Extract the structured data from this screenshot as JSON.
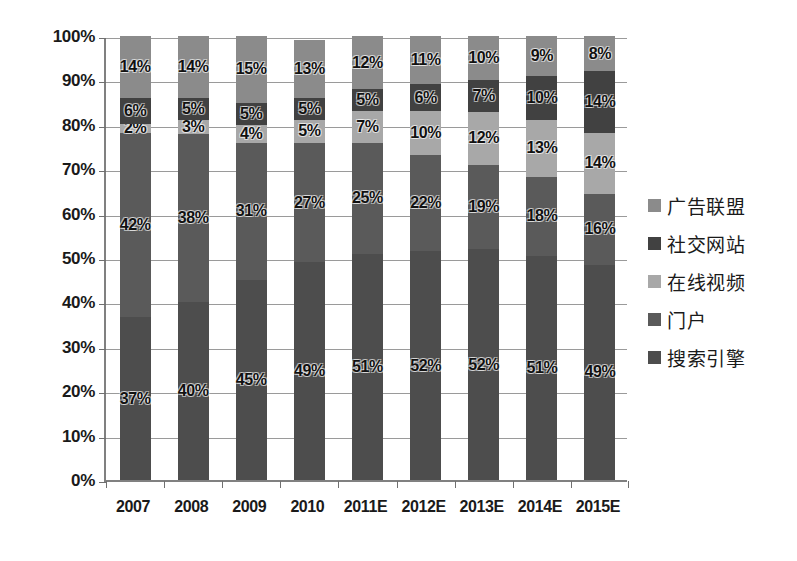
{
  "chart_data": {
    "type": "bar",
    "stacked": true,
    "stack_total": 100,
    "title": "",
    "subtitle": "",
    "xlabel": "",
    "ylabel": "",
    "ylim": [
      0,
      100
    ],
    "yticks": [
      "0%",
      "10%",
      "20%",
      "30%",
      "40%",
      "50%",
      "60%",
      "70%",
      "80%",
      "90%",
      "100%"
    ],
    "ytick_values": [
      0,
      10,
      20,
      30,
      40,
      50,
      60,
      70,
      80,
      90,
      100
    ],
    "grid": true,
    "grid_axis": "y",
    "legend_position": "right",
    "value_label_suffix": "%",
    "categories": [
      "2007",
      "2008",
      "2009",
      "2010",
      "2011E",
      "2012E",
      "2013E",
      "2014E",
      "2015E"
    ],
    "series": [
      {
        "name": "搜索引擎",
        "color": "#4d4d4d",
        "values": [
          37,
          40,
          45,
          49,
          51,
          52,
          52,
          51,
          49
        ],
        "labels": [
          "37%",
          "40%",
          "45%",
          "49%",
          "51%",
          "52%",
          "52%",
          "51%",
          "49%"
        ]
      },
      {
        "name": "门户",
        "color": "#5a5a5a",
        "values": [
          42,
          38,
          31,
          27,
          25,
          22,
          19,
          18,
          16
        ],
        "labels": [
          "42%",
          "38%",
          "31%",
          "27%",
          "25%",
          "22%",
          "19%",
          "18%",
          "16%"
        ]
      },
      {
        "name": "在线视频",
        "color": "#a8a8a8",
        "values": [
          2,
          3,
          4,
          5,
          7,
          10,
          12,
          13,
          14
        ],
        "labels": [
          "2%",
          "3%",
          "4%",
          "5%",
          "7%",
          "10%",
          "12%",
          "13%",
          "14%"
        ]
      },
      {
        "name": "社交网站",
        "color": "#414141",
        "values": [
          6,
          5,
          5,
          5,
          5,
          6,
          7,
          10,
          14
        ],
        "labels": [
          "6%",
          "5%",
          "5%",
          "5%",
          "5%",
          "6%",
          "7%",
          "10%",
          "14%"
        ]
      },
      {
        "name": "广告联盟",
        "color": "#8b8b8b",
        "values": [
          14,
          14,
          15,
          13,
          12,
          11,
          10,
          9,
          8
        ],
        "labels": [
          "14%",
          "14%",
          "15%",
          "13%",
          "12%",
          "11%",
          "10%",
          "9%",
          "8%"
        ]
      }
    ],
    "legend_entries": [
      {
        "label": "广告联盟",
        "color": "#8b8b8b"
      },
      {
        "label": "社交网站",
        "color": "#414141"
      },
      {
        "label": "在线视频",
        "color": "#a8a8a8"
      },
      {
        "label": "门户",
        "color": "#5a5a5a"
      },
      {
        "label": "搜索引擎",
        "color": "#4d4d4d"
      }
    ]
  }
}
